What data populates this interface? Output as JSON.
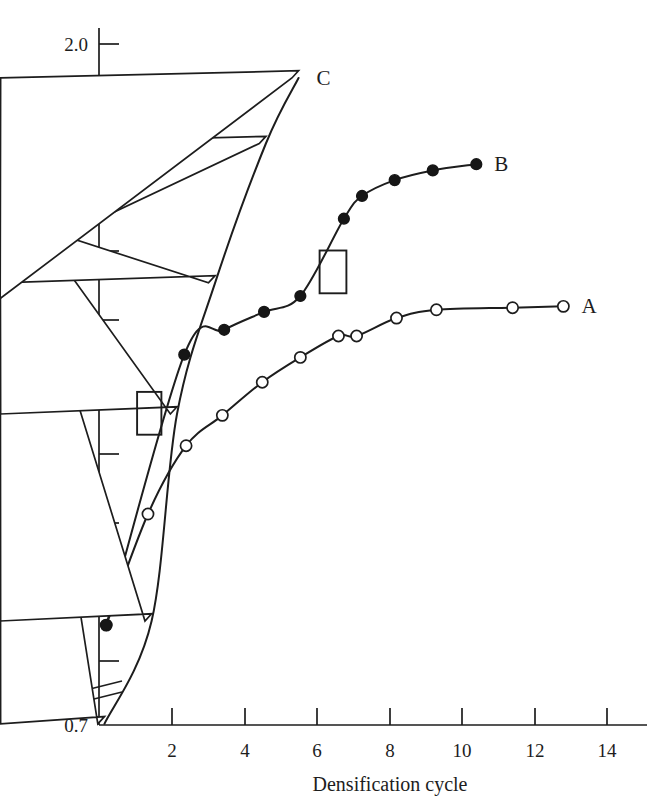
{
  "chart_data": {
    "type": "line",
    "title": "",
    "xlabel": "Densification cycle",
    "ylabel": "Density (g cm−3)",
    "ylabel_base": "Density (g cm",
    "ylabel_sup": "−3",
    "ylabel_close": ")",
    "xlim": [
      0,
      15.4
    ],
    "ylim": [
      0.7,
      2.05
    ],
    "grid": false,
    "legend_position": "inline-end-of-curve",
    "axis_break": {
      "present": true,
      "axis": "y",
      "between": [
        0.7,
        1.1
      ],
      "style": "double-slash"
    },
    "xticks": [
      2,
      4,
      6,
      8,
      10,
      12,
      14
    ],
    "xtick_labels": [
      "2",
      "4",
      "6",
      "8",
      "10",
      "12",
      "14"
    ],
    "yticks": [
      0.7,
      1.1,
      1.2,
      1.3,
      1.4,
      1.5,
      1.6,
      1.7,
      1.8,
      1.9,
      2.0
    ],
    "ytick_labels": [
      "0.7",
      "1.1",
      "1.2",
      "1.3",
      "1.4",
      "1.5",
      "1.6",
      "1.7",
      "1.8",
      "1.9",
      "2.0"
    ],
    "series": [
      {
        "name": "A",
        "label": "A",
        "marker": "open-circle",
        "x": [
          0.2,
          1.35,
          2.4,
          3.4,
          4.5,
          5.55,
          6.6,
          7.1,
          8.2,
          9.3,
          11.4,
          12.8
        ],
        "y": [
          1.152,
          1.313,
          1.412,
          1.456,
          1.504,
          1.54,
          1.571,
          1.571,
          1.597,
          1.609,
          1.612,
          1.614
        ]
      },
      {
        "name": "B",
        "label": "B",
        "marker": "filled-circle",
        "x": [
          0.2,
          2.35,
          3.45,
          4.55,
          5.55,
          6.75,
          7.25,
          8.15,
          9.2,
          10.4
        ],
        "y": [
          1.152,
          1.544,
          1.58,
          1.606,
          1.629,
          1.741,
          1.774,
          1.797,
          1.811,
          1.82
        ]
      },
      {
        "name": "C",
        "label": "C",
        "marker": "open-triangle",
        "x": [
          0.15,
          1.45,
          2.15,
          3.2,
          4.6,
          5.5
        ],
        "y": [
          0.72,
          1.158,
          1.458,
          1.648,
          1.85,
          1.945
        ]
      }
    ],
    "annotations": [
      {
        "name": "box-lower",
        "x_range": [
          1.05,
          1.72
        ],
        "y_range": [
          1.428,
          1.49
        ]
      },
      {
        "name": "box-upper",
        "x_range": [
          6.08,
          6.82
        ],
        "y_range": [
          1.633,
          1.695
        ]
      }
    ]
  }
}
